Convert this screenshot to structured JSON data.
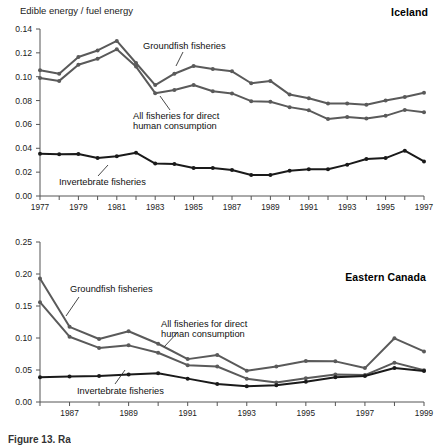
{
  "figure": {
    "axis_label": "Edible energy / fuel energy",
    "caption": "Figure 13. Ra"
  },
  "colors": {
    "groundfish": "#5a5a5a",
    "all_fisheries": "#5a5a5a",
    "invertebrate": "#1a1a1a",
    "axis": "#555555",
    "text": "#111111"
  },
  "panels": [
    {
      "id": "iceland",
      "title": "Iceland",
      "series_labels": {
        "groundfish": "Groundfish fisheries",
        "all_fisheries_line1": "All fisheries for direct",
        "all_fisheries_line2": "human consumption",
        "invertebrate": "Invertebrate fisheries"
      }
    },
    {
      "id": "eastern-canada",
      "title": "Eastern Canada",
      "series_labels": {
        "groundfish": "Groundfish fisheries",
        "all_fisheries_line1": "All fisheries for direct",
        "all_fisheries_line2": "human consumption",
        "invertebrate": "Invertebrate fisheries"
      }
    }
  ],
  "chart_data": [
    {
      "type": "line",
      "title": "Iceland",
      "xlabel": "",
      "ylabel": "Edible energy / fuel energy",
      "xlim": [
        1977,
        1997
      ],
      "ylim": [
        0.0,
        0.14
      ],
      "yticks": [
        0.0,
        0.02,
        0.04,
        0.06,
        0.08,
        0.1,
        0.12,
        0.14
      ],
      "ytick_labels": [
        "0.00",
        "0.02",
        "0.04",
        "0.06",
        "0.08",
        "0.10",
        "0.12",
        "0.14"
      ],
      "x": [
        1977,
        1978,
        1979,
        1980,
        1981,
        1982,
        1983,
        1984,
        1985,
        1986,
        1987,
        1988,
        1989,
        1990,
        1991,
        1992,
        1993,
        1994,
        1995,
        1996,
        1997
      ],
      "xtick_labels": [
        "1977",
        "",
        "1979",
        "",
        "1981",
        "",
        "1983",
        "",
        "1985",
        "",
        "1987",
        "",
        "1989",
        "",
        "1991",
        "",
        "1993",
        "",
        "1995",
        "",
        "1997"
      ],
      "grid": false,
      "legend": "annotations",
      "series": [
        {
          "name": "Groundfish fisheries",
          "values": [
            0.1055,
            0.1025,
            0.1165,
            0.122,
            0.13,
            0.1115,
            0.093,
            0.1025,
            0.109,
            0.1065,
            0.1045,
            0.0945,
            0.0965,
            0.085,
            0.082,
            0.0775,
            0.0775,
            0.0765,
            0.08,
            0.083,
            0.0865
          ]
        },
        {
          "name": "All fisheries for direct human consumption",
          "values": [
            0.099,
            0.0965,
            0.11,
            0.115,
            0.123,
            0.1085,
            0.0862,
            0.0888,
            0.093,
            0.0878,
            0.086,
            0.0795,
            0.079,
            0.0745,
            0.0718,
            0.0645,
            0.0663,
            0.065,
            0.0672,
            0.0722,
            0.0702
          ]
        },
        {
          "name": "Invertebrate fisheries",
          "values": [
            0.0355,
            0.035,
            0.0352,
            0.0318,
            0.0333,
            0.0363,
            0.0272,
            0.0268,
            0.0235,
            0.0235,
            0.0218,
            0.0176,
            0.0176,
            0.0212,
            0.0225,
            0.0225,
            0.0263,
            0.031,
            0.0318,
            0.038,
            0.029
          ]
        }
      ]
    },
    {
      "type": "line",
      "title": "Eastern Canada",
      "xlabel": "",
      "ylabel": "",
      "xlim": [
        1986,
        1999
      ],
      "ylim": [
        0.0,
        0.25
      ],
      "yticks": [
        0.0,
        0.05,
        0.1,
        0.15,
        0.2,
        0.25
      ],
      "ytick_labels": [
        "0.00",
        "0.05",
        "0.10",
        "0.15",
        "0.20",
        "0.25"
      ],
      "x": [
        1986,
        1987,
        1988,
        1989,
        1990,
        1991,
        1992,
        1993,
        1994,
        1995,
        1996,
        1997,
        1998,
        1999
      ],
      "xtick_labels": [
        "",
        "1987",
        "",
        "1989",
        "",
        "1991",
        "",
        "1993",
        "",
        "1995",
        "",
        "1997",
        "",
        "1999"
      ],
      "grid": false,
      "legend": "annotations",
      "series": [
        {
          "name": "Groundfish fisheries",
          "values": [
            0.193,
            0.1175,
            0.0985,
            0.1105,
            0.091,
            0.067,
            0.0735,
            0.049,
            0.0555,
            0.064,
            0.0635,
            0.053,
            0.0995,
            0.079
          ]
        },
        {
          "name": "All fisheries for direct human consumption",
          "values": [
            0.156,
            0.102,
            0.0845,
            0.0885,
            0.077,
            0.0575,
            0.0555,
            0.0365,
            0.0305,
            0.037,
            0.043,
            0.042,
            0.0615,
            0.0495
          ]
        },
        {
          "name": "Invertebrate fisheries",
          "values": [
            0.0385,
            0.04,
            0.0405,
            0.0428,
            0.0448,
            0.0365,
            0.028,
            0.0245,
            0.0262,
            0.0318,
            0.0388,
            0.0405,
            0.053,
            0.0485
          ]
        }
      ]
    }
  ]
}
